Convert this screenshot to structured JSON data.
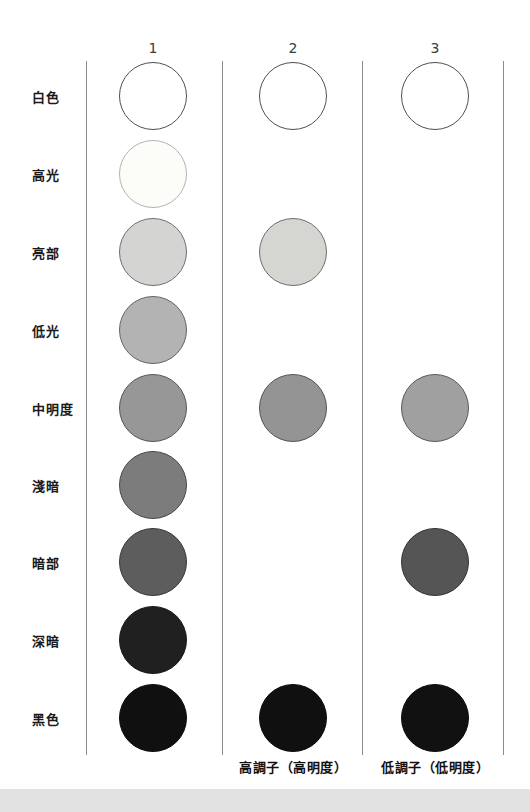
{
  "page": {
    "background_color": "#ffffff",
    "footer_bar_color": "#e2e2e2",
    "divider_color": "#8c8c8c"
  },
  "row_labels": [
    {
      "label": "白色"
    },
    {
      "label": "高光"
    },
    {
      "label": "亮部"
    },
    {
      "label": "低光"
    },
    {
      "label": "中明度"
    },
    {
      "label": "淺暗"
    },
    {
      "label": "暗部"
    },
    {
      "label": "深暗"
    },
    {
      "label": "黑色"
    }
  ],
  "columns": [
    {
      "header": "1",
      "circles": [
        {
          "row": 0,
          "tone": "白色",
          "fill": "#ffffff",
          "stroke": "#4f4f4f"
        },
        {
          "row": 1,
          "tone": "高光",
          "fill": "#fcfcf9",
          "stroke": "#b3b3b0"
        },
        {
          "row": 2,
          "tone": "亮部",
          "fill": "#d4d4d2",
          "stroke": "#707070"
        },
        {
          "row": 3,
          "tone": "低光",
          "fill": "#b3b3b3",
          "stroke": "#646464"
        },
        {
          "row": 4,
          "tone": "中明度",
          "fill": "#979797",
          "stroke": "#565656"
        },
        {
          "row": 5,
          "tone": "淺暗",
          "fill": "#7c7c7c",
          "stroke": "#484848"
        },
        {
          "row": 6,
          "tone": "暗部",
          "fill": "#5d5d5d",
          "stroke": "#383838"
        },
        {
          "row": 7,
          "tone": "深暗",
          "fill": "#202020",
          "stroke": "#1a1a1a"
        },
        {
          "row": 8,
          "tone": "黑色",
          "fill": "#101010",
          "stroke": "#0d0d0d"
        }
      ],
      "caption": ""
    },
    {
      "header": "2",
      "circles": [
        {
          "row": 0,
          "tone": "白色",
          "fill": "#ffffff",
          "stroke": "#4f4f4f"
        },
        {
          "row": 2,
          "tone": "亮部",
          "fill": "#d5d5d1",
          "stroke": "#6e6e6e"
        },
        {
          "row": 4,
          "tone": "中明度",
          "fill": "#949494",
          "stroke": "#545454"
        },
        {
          "row": 8,
          "tone": "黑色",
          "fill": "#101010",
          "stroke": "#0d0d0d"
        }
      ],
      "caption": "高調子（高明度）"
    },
    {
      "header": "3",
      "circles": [
        {
          "row": 0,
          "tone": "白色",
          "fill": "#ffffff",
          "stroke": "#4f4f4f"
        },
        {
          "row": 4,
          "tone": "中明度",
          "fill": "#a0a0a0",
          "stroke": "#5a5a5a"
        },
        {
          "row": 6,
          "tone": "暗部",
          "fill": "#555555",
          "stroke": "#343434"
        },
        {
          "row": 8,
          "tone": "黑色",
          "fill": "#111111",
          "stroke": "#0d0d0d"
        }
      ],
      "caption": "低調子（低明度）"
    }
  ]
}
